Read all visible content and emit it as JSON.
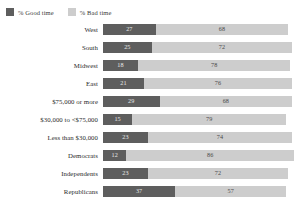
{
  "legend": {
    "items": [
      {
        "label": "% Good time",
        "color": "#5e5e5e",
        "icon": "legend-swatch-good"
      },
      {
        "label": "% Bad time",
        "color": "#cdcdcd",
        "icon": "legend-swatch-bad"
      }
    ]
  },
  "chart_data": {
    "type": "bar",
    "orientation": "horizontal",
    "stacked": true,
    "title": "",
    "subtitle": "",
    "xlabel": "",
    "ylabel": "",
    "grid": false,
    "legend_position": "top-left",
    "xlim": [
      0,
      100
    ],
    "categories": [
      "West",
      "South",
      "Midwest",
      "East",
      "$75,000 or more",
      "$30,000 to <$75,000",
      "Less than $30,000",
      "Democrats",
      "Independents",
      "Republicans"
    ],
    "series": [
      {
        "name": "% Good time",
        "color": "#5e5e5e",
        "values": [
          27,
          25,
          18,
          21,
          29,
          15,
          23,
          12,
          23,
          37
        ]
      },
      {
        "name": "% Bad time",
        "color": "#cdcdcd",
        "values": [
          68,
          72,
          78,
          76,
          68,
          79,
          74,
          86,
          72,
          57
        ]
      }
    ]
  }
}
